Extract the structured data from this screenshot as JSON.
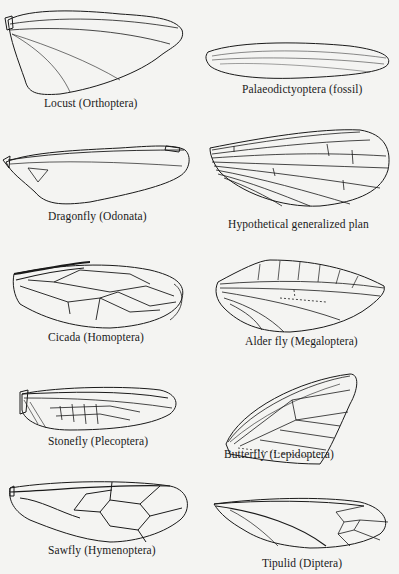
{
  "figure": {
    "panels": [
      {
        "id": "locust",
        "label": "Locust (Orthoptera)",
        "column": "left",
        "row": 1,
        "venation": "dense-reticulate"
      },
      {
        "id": "palaeodictyoptera",
        "label": "Palaeodictyoptera (fossil)",
        "column": "right",
        "row": 1,
        "venation": "dense-reticulate-fossil"
      },
      {
        "id": "dragonfly",
        "label": "Dragonfly (Odonata)",
        "column": "left",
        "row": 2,
        "venation": "dense-reticulate"
      },
      {
        "id": "hypothetical",
        "label": "Hypothetical generalized plan",
        "column": "right",
        "row": 2,
        "venation": "generalized"
      },
      {
        "id": "cicada",
        "label": "Cicada (Homoptera)",
        "column": "left",
        "row": 3,
        "venation": "sparse"
      },
      {
        "id": "alderfly",
        "label": "Alder fly (Megaloptera)",
        "column": "right",
        "row": 3,
        "venation": "moderate"
      },
      {
        "id": "stonefly",
        "label": "Stonefly (Plecoptera)",
        "column": "left",
        "row": 4,
        "venation": "moderate"
      },
      {
        "id": "butterfly",
        "label": "Butterfly (Lepidoptera)",
        "column": "right",
        "row": 4,
        "venation": "sparse"
      },
      {
        "id": "sawfly",
        "label": "Sawfly (Hymenoptera)",
        "column": "left",
        "row": 5,
        "venation": "cellular"
      },
      {
        "id": "tipulid",
        "label": "Tipulid (Diptera)",
        "column": "right",
        "row": 5,
        "venation": "sparse"
      }
    ]
  }
}
